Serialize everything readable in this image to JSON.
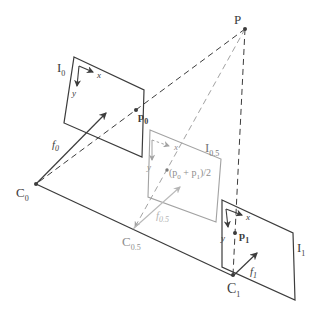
{
  "figure": {
    "type": "stereo-view-interpolation-diagram",
    "colors": {
      "background": "#ffffff",
      "ink": "#3c3c3c",
      "plane_gray": "#a2a2a2",
      "light_gray": "#b9b9b9",
      "gray_text": "#8e8e8e",
      "dark_gray_text": "#777777"
    },
    "labels": {
      "point_P": {
        "main": "P"
      },
      "plane_I0": {
        "main": "I",
        "sub": "0"
      },
      "plane_I05": {
        "main": "I",
        "sub": "0.5"
      },
      "plane_I1": {
        "main": "I",
        "sub": "1"
      },
      "focal_f0": {
        "main": "f",
        "sub": "0"
      },
      "focal_f05": {
        "main": "f",
        "sub": "0.5"
      },
      "focal_f1": {
        "main": "f",
        "sub": "1"
      },
      "center_C0": {
        "main": "C",
        "sub": "0"
      },
      "center_C05": {
        "main": "C",
        "sub": "0.5"
      },
      "center_C1": {
        "main": "C",
        "sub": "1"
      },
      "point_p0": {
        "main": "p",
        "sub": "0"
      },
      "point_p1": {
        "main": "p",
        "sub": "1"
      },
      "midpoint": {
        "open": "(p",
        "sub0": "0",
        "plus": " + p",
        "sub1": "1",
        "close": ")/2"
      },
      "axis_x": "x",
      "axis_y": "y"
    }
  }
}
